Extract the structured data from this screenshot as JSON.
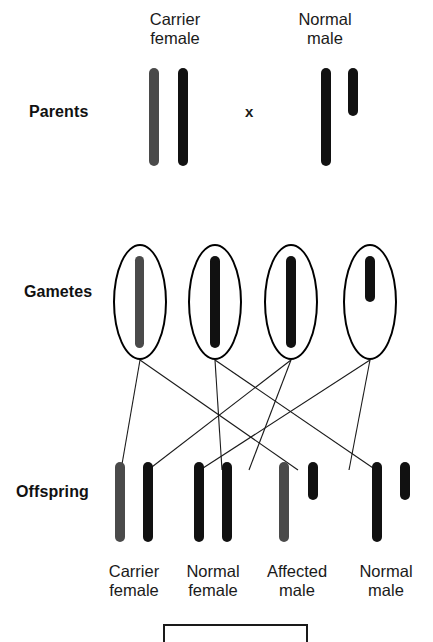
{
  "figure": {
    "background_color": "#ffffff",
    "colors": {
      "normal_allele_chromosome": "#111111",
      "carrier_allele_chromosome": "#4a4a4a",
      "outline": "#000000",
      "text": "#1a1a1a"
    }
  },
  "row_labels": {
    "parents": "Parents",
    "gametes": "Gametes",
    "offspring": "Offspring"
  },
  "cross_symbol": "x",
  "parents": [
    {
      "label_line1": "Carrier",
      "label_line2": "female",
      "sex": "female",
      "chromosomes": [
        {
          "name": "X-carrier",
          "color": "#4a4a4a",
          "length": "long"
        },
        {
          "name": "X-normal",
          "color": "#111111",
          "length": "long"
        }
      ]
    },
    {
      "label_line1": "Normal",
      "label_line2": "male",
      "sex": "male",
      "chromosomes": [
        {
          "name": "X-normal",
          "color": "#111111",
          "length": "long"
        },
        {
          "name": "Y",
          "color": "#111111",
          "length": "short"
        }
      ]
    }
  ],
  "gametes": [
    {
      "name": "egg-X-carrier",
      "color": "#4a4a4a",
      "length": "long",
      "from": "Carrier female"
    },
    {
      "name": "egg-X-normal",
      "color": "#111111",
      "length": "long",
      "from": "Carrier female"
    },
    {
      "name": "sperm-X-normal",
      "color": "#111111",
      "length": "long",
      "from": "Normal male"
    },
    {
      "name": "sperm-Y",
      "color": "#111111",
      "length": "short",
      "from": "Normal male"
    }
  ],
  "offspring": [
    {
      "label_line1": "Carrier",
      "label_line2": "female",
      "chromosomes": [
        {
          "name": "X-carrier",
          "color": "#4a4a4a",
          "length": "long"
        },
        {
          "name": "X-normal",
          "color": "#111111",
          "length": "long"
        }
      ]
    },
    {
      "label_line1": "Normal",
      "label_line2": "female",
      "chromosomes": [
        {
          "name": "X-normal",
          "color": "#111111",
          "length": "long"
        },
        {
          "name": "X-normal",
          "color": "#111111",
          "length": "long"
        }
      ]
    },
    {
      "label_line1": "Affected",
      "label_line2": "male",
      "chromosomes": [
        {
          "name": "X-carrier",
          "color": "#4a4a4a",
          "length": "long"
        },
        {
          "name": "Y",
          "color": "#111111",
          "length": "short"
        }
      ]
    },
    {
      "label_line1": "Normal",
      "label_line2": "male",
      "chromosomes": [
        {
          "name": "X-normal",
          "color": "#111111",
          "length": "long"
        },
        {
          "name": "Y",
          "color": "#111111",
          "length": "short"
        }
      ]
    }
  ]
}
